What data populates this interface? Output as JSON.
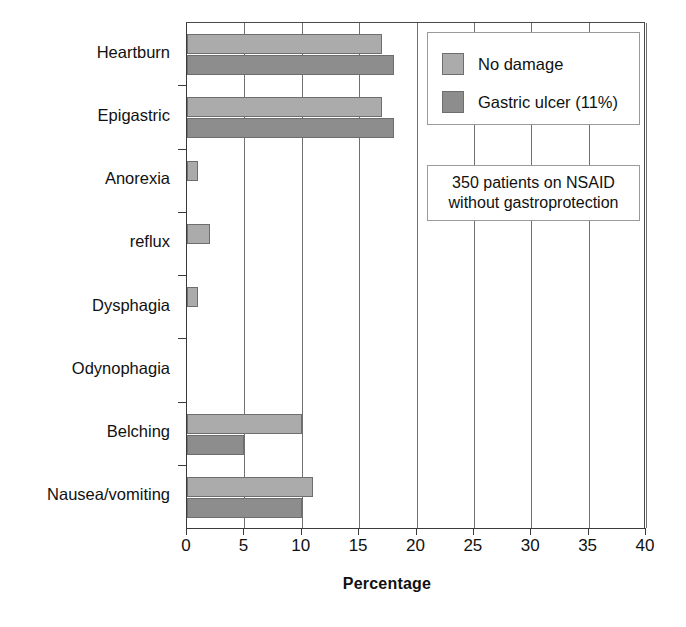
{
  "chart_data": {
    "type": "bar",
    "orientation": "horizontal",
    "title": "",
    "xlabel": "Percentage",
    "ylabel": "",
    "xlim": [
      0,
      40
    ],
    "xticks": [
      0,
      5,
      10,
      15,
      20,
      25,
      30,
      35,
      40
    ],
    "grid": "vertical",
    "legend_position": "top-right",
    "categories": [
      "Heartburn",
      "Epigastric",
      "Anorexia",
      "reflux",
      "Dysphagia",
      "Odynophagia",
      "Belching",
      "Nausea/vomiting"
    ],
    "series": [
      {
        "name": "No damage",
        "color": "#ababab",
        "values": [
          17,
          17,
          1,
          2,
          1,
          0,
          10,
          11
        ]
      },
      {
        "name": "Gastric ulcer (11%)",
        "color": "#8d8d8d",
        "values": [
          18,
          18,
          0,
          0,
          0,
          0,
          5,
          10
        ]
      }
    ],
    "annotations": [
      {
        "name": "sample-note",
        "lines": [
          "350 patients on NSAID",
          "without gastroprotection"
        ]
      }
    ]
  },
  "legend": {
    "items": [
      {
        "label": "No damage",
        "color": "#ababab"
      },
      {
        "label": "Gastric ulcer (11%)",
        "color": "#8d8d8d"
      }
    ]
  },
  "annotation": {
    "line1": "350 patients on NSAID",
    "line2": "without gastroprotection"
  },
  "axes": {
    "x_title": "Percentage",
    "x_tick_labels": [
      "0",
      "5",
      "10",
      "15",
      "20",
      "25",
      "30",
      "35",
      "40"
    ],
    "y_tick_labels": [
      "Heartburn",
      "Epigastric",
      "Anorexia",
      "reflux",
      "Dysphagia",
      "Odynophagia",
      "Belching",
      "Nausea/vomiting"
    ]
  }
}
